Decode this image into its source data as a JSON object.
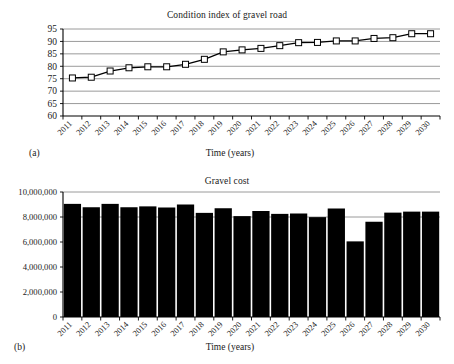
{
  "figures": {
    "a": {
      "panel_letter": "(a)",
      "xlabel": "Time (years)"
    },
    "b": {
      "panel_letter": "(b)",
      "xlabel": "Time (years)"
    }
  },
  "chart_data": [
    {
      "type": "line",
      "title": "Condition index of gravel road",
      "xlabel": "Time (years)",
      "ylabel": "",
      "categories": [
        "2011",
        "2012",
        "2013",
        "2014",
        "2015",
        "2016",
        "2017",
        "2018",
        "2019",
        "2020",
        "2021",
        "2022",
        "2023",
        "2024",
        "2025",
        "2026",
        "2027",
        "2028",
        "2029",
        "2030"
      ],
      "values": [
        75.3,
        75.6,
        78.1,
        79.4,
        79.8,
        79.8,
        80.8,
        82.8,
        85.8,
        86.6,
        87.2,
        88.3,
        89.5,
        89.6,
        90.2,
        90.2,
        91.2,
        91.5,
        93.1,
        93.1
      ],
      "ylim": [
        60,
        95
      ],
      "yticks": [
        60,
        65,
        70,
        75,
        80,
        85,
        90,
        95
      ],
      "ytick_labels": [
        "60",
        "65",
        "70",
        "75",
        "80",
        "85",
        "90",
        "95"
      ],
      "grid": true,
      "marker": "square-open",
      "legend": false,
      "line_color": "#000000",
      "grid_color": "#808080"
    },
    {
      "type": "bar",
      "title": "Gravel cost",
      "xlabel": "Time (years)",
      "ylabel": "",
      "categories": [
        "2011",
        "2012",
        "2013",
        "2014",
        "2015",
        "2016",
        "2017",
        "2018",
        "2019",
        "2020",
        "2021",
        "2022",
        "2023",
        "2024",
        "2025",
        "2026",
        "2027",
        "2028",
        "2029",
        "2030"
      ],
      "values": [
        9050000,
        8780000,
        9050000,
        8780000,
        8850000,
        8760000,
        9000000,
        8330000,
        8700000,
        8070000,
        8480000,
        8250000,
        8280000,
        7990000,
        8680000,
        6050000,
        7620000,
        8350000,
        8430000,
        8430000
      ],
      "ylim": [
        0,
        10000000
      ],
      "yticks": [
        0,
        2000000,
        4000000,
        6000000,
        8000000,
        10000000
      ],
      "ytick_labels": [
        "0",
        "2,000,000",
        "4,000,000",
        "6,000,000",
        "8,000,000",
        "10,000,000"
      ],
      "grid": true,
      "legend": false,
      "bar_color": "#000000",
      "grid_color": "#808080"
    }
  ]
}
